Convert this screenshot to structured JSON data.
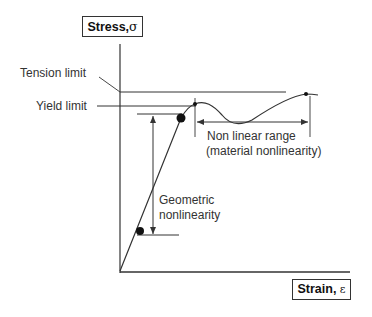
{
  "y_axis": {
    "label": "Stress,",
    "symbol": "σ"
  },
  "x_axis": {
    "label": "Strain,",
    "symbol": "ε"
  },
  "annotations": {
    "tension_limit": "Tension limit",
    "yield_limit": "Yield limit",
    "nonlinear_range_line1": "Non linear range",
    "nonlinear_range_line2": "(material nonlinearity)",
    "geometric_line1": "Geometric",
    "geometric_line2": "nonlinearity"
  },
  "colors": {
    "line": "#333333",
    "background": "#ffffff"
  }
}
